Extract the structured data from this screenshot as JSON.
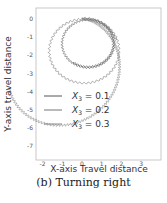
{
  "chart_data": {
    "type": "line",
    "title": "",
    "xlabel": "X-axis Travel distance",
    "ylabel": "Y-axis travel distance",
    "xlim": [
      -2.3,
      3.9
    ],
    "ylim": [
      -7.8,
      0.6
    ],
    "xticks": [
      -2,
      -1,
      0,
      1,
      2,
      3
    ],
    "yticks": [
      0,
      -1,
      -2,
      -3,
      -4,
      -5,
      -6,
      -7
    ],
    "grid": false,
    "legend_position": "lower left",
    "series": [
      {
        "name": "X3 = 0.1",
        "label_sub": "3",
        "label_value": "0.1",
        "color": "#555555",
        "shape": "circle",
        "center": [
          0.3,
          -1.35
        ],
        "radius": 1.35,
        "turns": 1.6
      },
      {
        "name": "X3 = 0.2",
        "label_sub": "3",
        "label_value": "0.2",
        "color": "#777777",
        "shape": "circle",
        "center": [
          0.1,
          -1.75
        ],
        "radius": 1.8,
        "turns": 1.2
      },
      {
        "name": "X3 = 0.3",
        "label_sub": "3",
        "label_value": "0.3",
        "color": "#888888",
        "shape": "spiral",
        "start": [
          0.0,
          0.0
        ],
        "extent": {
          "x_max": 3.5,
          "y_min": -7.4
        }
      }
    ]
  },
  "caption": "(b) Turning right"
}
